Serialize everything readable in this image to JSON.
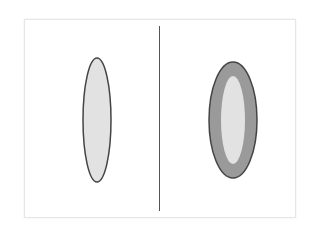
{
  "figure": {
    "type": "two-panel line illustration",
    "text_labels": [],
    "panels": [
      {
        "id": "left",
        "description": "abstract elongated light-gray shape"
      },
      {
        "id": "right",
        "description": "abstract elongated shape with darker gray outer band"
      }
    ],
    "colors": {
      "background": "#ffffff",
      "frame_border": "#e6e6e6",
      "outline": "#444444",
      "light_fill": "#e2e2e2",
      "dark_fill": "#9a9a9a",
      "divider": "#555555"
    }
  }
}
